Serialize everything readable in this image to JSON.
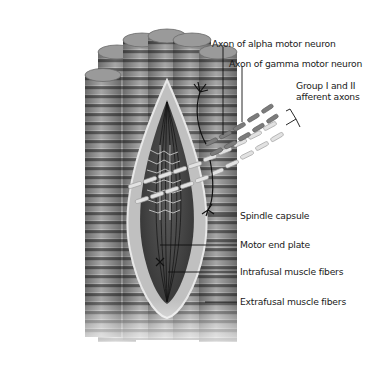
{
  "diagram": {
    "labels": {
      "alpha_axon": "Axon of alpha motor neuron",
      "gamma_axon": "Axon of gamma motor neuron",
      "afferent_line1": "Group I and II",
      "afferent_line2": "afferent axons",
      "spindle_capsule": "Spindle capsule",
      "motor_end_plate": "Motor end plate",
      "intrafusal": "Intrafusal muscle fibers",
      "extrafusal": "Extrafusal muscle fibers"
    },
    "colors": {
      "background": "#ffffff",
      "fiber_light": "#a8a8a8",
      "fiber_dark": "#5e5e5e",
      "fiber_top": "#9c9c9c",
      "capsule": "#b8b8b8",
      "capsule_edge": "#e6e6e6",
      "spindle_interior": "#4a4a4a",
      "axon_dark": "#7a7a7a",
      "axon_light": "#e0e0e0",
      "nerve_line": "#111111",
      "text": "#1a1a1a"
    }
  }
}
